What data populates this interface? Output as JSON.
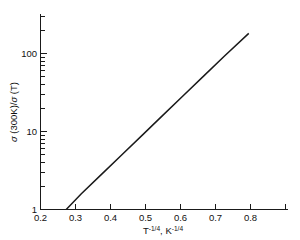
{
  "chart_data": {
    "type": "line",
    "title": "",
    "subtitle": "",
    "xlabel": "T -1/4, K -1/4",
    "xlabel_parts": {
      "base1": "T",
      "exp1": "-1/4",
      "sep": ", ",
      "base2": "K",
      "exp2": "-1/4"
    },
    "ylabel": "σ (300K)/σ (T)",
    "ylabel_parts": {
      "sigma1": "σ",
      "num": " (300K)/",
      "sigma2": "σ",
      "den": " (T)"
    },
    "xscale": "linear",
    "yscale": "log",
    "xlim": [
      0.2,
      0.8
    ],
    "ylim": [
      1,
      300
    ],
    "grid": false,
    "legend": null,
    "legend_position": "none",
    "xticks": [
      0.2,
      0.3,
      0.4,
      0.5,
      0.6,
      0.7,
      0.8
    ],
    "xticklabels": [
      "0.2",
      "0.3",
      "0.4",
      "0.5",
      "0.6",
      "0.7",
      "0.8"
    ],
    "yticks": [
      1,
      10,
      100
    ],
    "yticklabels": [
      "1",
      "10",
      "100"
    ],
    "yminorticks": [
      2,
      3,
      4,
      5,
      6,
      7,
      8,
      9,
      20,
      30,
      40,
      50,
      60,
      70,
      80,
      90,
      200,
      300
    ],
    "series": [
      {
        "name": "conductivity-ratio",
        "color": "#1a1a1a",
        "x": [
          0.263,
          0.3,
          0.35,
          0.4,
          0.45,
          0.5,
          0.55,
          0.6,
          0.65,
          0.71
        ],
        "y": [
          1.0,
          1.59,
          2.84,
          5.07,
          9.06,
          16.2,
          28.9,
          51.6,
          92.2,
          181.0
        ]
      }
    ],
    "annotations": []
  },
  "axes": {
    "x_axis_name": "x-axis",
    "y_axis_name": "y-axis"
  }
}
